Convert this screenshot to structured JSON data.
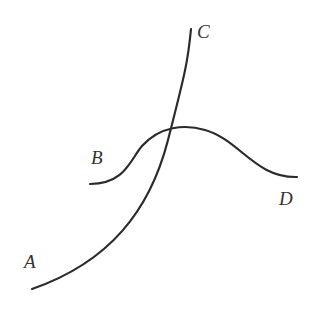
{
  "diagram": {
    "title": "",
    "stroke_color": "#2b2b2b",
    "label_color": "#333333",
    "curves": [
      {
        "id": "AC",
        "start_label": "A",
        "end_label": "C",
        "path": "M 32 289 C 110 262, 150 210, 168 140 S 188 60, 191 29"
      },
      {
        "id": "BD",
        "start_label": "B",
        "end_label": "D",
        "path": "M 90 184 C 125 184, 130 160, 142 146 C 160 126, 185 124, 205 130 C 240 140, 255 178, 297 177"
      }
    ],
    "labels": [
      {
        "text": "A",
        "x": 24,
        "y": 268
      },
      {
        "text": "B",
        "x": 91,
        "y": 164
      },
      {
        "text": "C",
        "x": 197,
        "y": 38
      },
      {
        "text": "D",
        "x": 279,
        "y": 205
      }
    ]
  }
}
